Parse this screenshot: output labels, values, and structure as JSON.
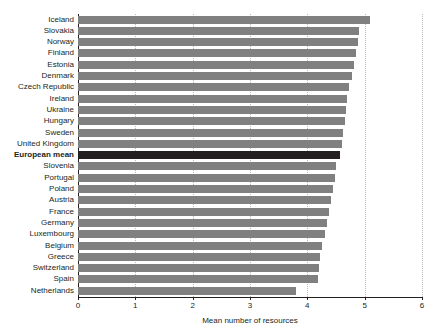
{
  "header": {
    "cropped_title": ""
  },
  "chart_data": {
    "type": "bar",
    "orientation": "horizontal",
    "title": "",
    "xlabel": "Mean number of resources",
    "ylabel": "",
    "xlim": [
      0,
      6
    ],
    "xticks": [
      0,
      1,
      2,
      3,
      4,
      5,
      6
    ],
    "xtick_labels": [
      "0",
      "1",
      "2",
      "3",
      "4",
      "5",
      "6"
    ],
    "grid": "vertical-dotted",
    "legend": "none",
    "bar_color": "#808080",
    "highlight_color": "#231f20",
    "highlight_category": "European mean",
    "categories": [
      "Iceland",
      "Slovakia",
      "Norway",
      "Finland",
      "Estonia",
      "Denmark",
      "Czech Republic",
      "Ireland",
      "Ukraine",
      "Hungary",
      "Sweden",
      "United Kingdom",
      "European mean",
      "Slovenia",
      "Portugal",
      "Poland",
      "Austria",
      "France",
      "Germany",
      "Luxembourg",
      "Belgium",
      "Greece",
      "Switzerland",
      "Spain",
      "Netherlands"
    ],
    "values": [
      5.1,
      4.9,
      4.88,
      4.85,
      4.82,
      4.78,
      4.72,
      4.7,
      4.68,
      4.65,
      4.62,
      4.6,
      4.57,
      4.5,
      4.48,
      4.45,
      4.42,
      4.38,
      4.35,
      4.3,
      4.25,
      4.22,
      4.2,
      4.18,
      3.8
    ]
  }
}
